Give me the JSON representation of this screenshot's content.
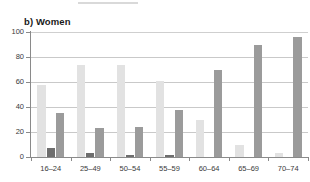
{
  "panel": {
    "label": "b) Women"
  },
  "chart_data": {
    "type": "bar",
    "title": "b) Women",
    "xlabel": "",
    "ylabel": "",
    "categories": [
      "16–24",
      "25–49",
      "50–54",
      "55–59",
      "60–64",
      "65–69",
      "70–74"
    ],
    "series": [
      {
        "name": "series-1",
        "color": "#e2e2e2",
        "values": [
          58,
          74,
          74,
          61,
          30,
          9.5,
          3.5
        ]
      },
      {
        "name": "series-2",
        "color": "#6e6e6e",
        "values": [
          7,
          3,
          2,
          1.5,
          0,
          0,
          0
        ]
      },
      {
        "name": "series-3",
        "color": "#9b9b9b",
        "values": [
          35.5,
          23,
          24,
          37.5,
          70,
          90,
          96
        ]
      }
    ],
    "ylim": [
      0,
      100
    ],
    "yticks": [
      0,
      20,
      40,
      60,
      80,
      100
    ],
    "ytick_labels": [
      "0",
      "20",
      "40",
      "60",
      "80",
      "100"
    ],
    "grid": true,
    "grid_axis": "y",
    "legend": "none"
  },
  "colors": {
    "series_1": "#e2e2e2",
    "series_2": "#6e6e6e",
    "series_3": "#9b9b9b",
    "grid": "#c9c9c9",
    "axis": "#8a8a8a",
    "text": "#3a3a3a",
    "title": "#1a1a1a",
    "background": "#ffffff"
  }
}
